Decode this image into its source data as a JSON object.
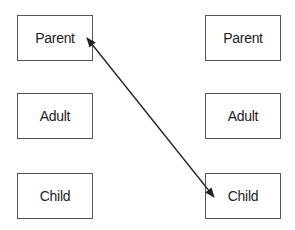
{
  "diagram": {
    "left_column": {
      "boxes": [
        {
          "label": "Parent"
        },
        {
          "label": "Adult"
        },
        {
          "label": "Child"
        }
      ]
    },
    "right_column": {
      "boxes": [
        {
          "label": "Parent"
        },
        {
          "label": "Adult"
        },
        {
          "label": "Child"
        }
      ]
    },
    "connections": [
      {
        "from": "left_column.Parent",
        "to": "right_column.Child",
        "type": "bidirectional-arrow"
      }
    ],
    "colors": {
      "border": "#555555",
      "text": "#222222",
      "arrow": "#222222"
    }
  }
}
